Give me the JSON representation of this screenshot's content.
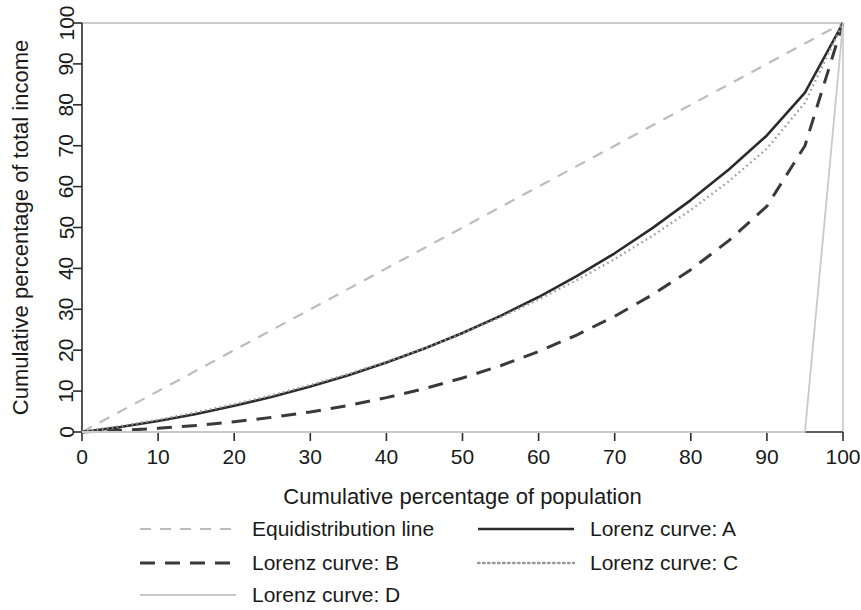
{
  "chart_data": {
    "type": "line",
    "title": "",
    "xlabel": "Cumulative percentage of population",
    "ylabel": "Cumulative percentage of total income",
    "xlim": [
      0,
      100
    ],
    "ylim": [
      0,
      100
    ],
    "xticks": [
      "0",
      "10",
      "20",
      "30",
      "40",
      "50",
      "60",
      "70",
      "80",
      "90",
      "100"
    ],
    "yticks": [
      "0",
      "10",
      "20",
      "30",
      "40",
      "50",
      "60",
      "70",
      "80",
      "90",
      "100"
    ],
    "grid": false,
    "legend_position": "bottom",
    "x": [
      0,
      5,
      10,
      15,
      20,
      25,
      30,
      35,
      40,
      45,
      50,
      55,
      60,
      65,
      70,
      75,
      80,
      85,
      90,
      95,
      100
    ],
    "series": [
      {
        "name": "Equidistribution line",
        "style": "dashed",
        "color": "#bcbcbc",
        "width": 2.2,
        "dash": "11 9",
        "values": [
          0,
          5,
          10,
          15,
          20,
          25,
          30,
          35,
          40,
          45,
          50,
          55,
          60,
          65,
          70,
          75,
          80,
          85,
          90,
          95,
          100
        ]
      },
      {
        "name": "Lorenz curve: A",
        "style": "solid",
        "color": "#2b2b2b",
        "width": 2.6,
        "dash": "",
        "values": [
          0,
          1.2,
          2.7,
          4.4,
          6.4,
          8.6,
          11.1,
          13.9,
          17.0,
          20.4,
          24.2,
          28.4,
          33.0,
          38.1,
          43.7,
          49.9,
          56.7,
          64.2,
          72.5,
          83.0,
          100
        ]
      },
      {
        "name": "Lorenz curve: B",
        "style": "dashed",
        "color": "#3a3a3a",
        "width": 3.0,
        "dash": "15 10",
        "values": [
          0,
          0.4,
          0.9,
          1.6,
          2.5,
          3.6,
          4.9,
          6.5,
          8.4,
          10.6,
          13.2,
          16.2,
          19.7,
          23.7,
          28.3,
          33.6,
          39.7,
          46.8,
          55.2,
          70.0,
          100
        ]
      },
      {
        "name": "Lorenz curve: C",
        "style": "dotted",
        "color": "#9a9a9a",
        "width": 2.4,
        "dash": "1.6 3.4",
        "values": [
          0,
          1.4,
          3.0,
          4.8,
          6.8,
          9.0,
          11.5,
          14.2,
          17.2,
          20.5,
          24.1,
          28.1,
          32.4,
          37.1,
          42.3,
          48.0,
          54.3,
          61.3,
          69.3,
          80.5,
          100
        ]
      },
      {
        "name": "Lorenz curve: D",
        "style": "solid",
        "color": "#c9c9c9",
        "width": 1.8,
        "dash": "",
        "values": [
          0,
          0,
          0,
          0,
          0,
          0,
          0,
          0,
          0,
          0,
          0,
          0,
          0,
          0,
          0,
          0,
          0,
          0,
          0,
          0,
          100
        ]
      }
    ],
    "legend_entries": [
      {
        "label": "Equidistribution line",
        "row": 0,
        "col": 0,
        "series_index": 0
      },
      {
        "label": "Lorenz curve: A",
        "row": 0,
        "col": 1,
        "series_index": 1
      },
      {
        "label": "Lorenz curve: B",
        "row": 1,
        "col": 0,
        "series_index": 2
      },
      {
        "label": "Lorenz curve: C",
        "row": 1,
        "col": 1,
        "series_index": 3
      },
      {
        "label": "Lorenz curve: D",
        "row": 2,
        "col": 0,
        "series_index": 4
      }
    ]
  },
  "colors": {
    "axis": "#2b2b2b",
    "box": "#bdbdbd",
    "background": "#ffffff",
    "text": "#1a1a1a"
  }
}
